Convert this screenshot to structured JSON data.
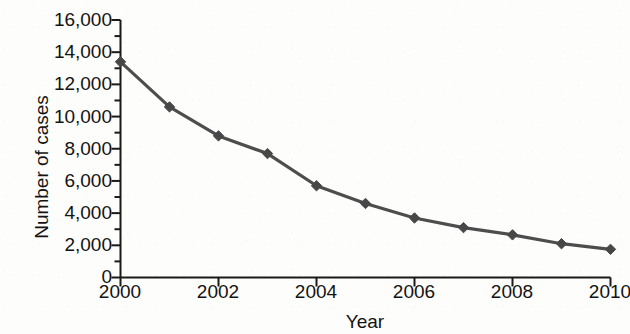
{
  "chart_data": {
    "type": "line",
    "title": "",
    "xlabel": "Year",
    "ylabel": "Number of cases",
    "x": [
      2000,
      2001,
      2002,
      2003,
      2004,
      2005,
      2006,
      2007,
      2008,
      2009,
      2010
    ],
    "values": [
      13400,
      10600,
      8800,
      7700,
      5700,
      4600,
      3700,
      3100,
      2650,
      2100,
      1750
    ],
    "series": [
      {
        "name": "Number of cases",
        "values": [
          13400,
          10600,
          8800,
          7700,
          5700,
          4600,
          3700,
          3100,
          2650,
          2100,
          1750
        ]
      }
    ],
    "xlim": [
      2000,
      2010
    ],
    "ylim": [
      0,
      16000
    ],
    "x_tick_labels": [
      "2000",
      "2002",
      "2004",
      "2006",
      "2008",
      "2010"
    ],
    "x_tick_values": [
      2000,
      2002,
      2004,
      2006,
      2008,
      2010
    ],
    "x_minor_tick_values": [
      2001,
      2003,
      2005,
      2007,
      2009
    ],
    "y_tick_labels": [
      "16,000",
      "14,000",
      "12,000",
      "10,000",
      "8,000",
      "6,000",
      "4,000",
      "2,000",
      "0"
    ],
    "y_tick_values": [
      16000,
      14000,
      12000,
      10000,
      8000,
      6000,
      4000,
      2000,
      0
    ],
    "y_minor_tick_values": [
      15000,
      13000,
      11000,
      9000,
      7000,
      5000,
      3000,
      1000
    ],
    "grid": false,
    "legend": false,
    "legend_position": "none",
    "marker": "diamond",
    "colors": {
      "line": "#4d4d4d",
      "marker": "#474747",
      "axis": "#1a1a1a",
      "text": "#131313",
      "background": "#fdfdfc"
    }
  }
}
